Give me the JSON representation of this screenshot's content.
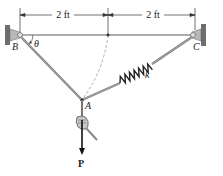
{
  "figure": {
    "dimensions": [
      {
        "id": "left",
        "label": "2 ft"
      },
      {
        "id": "right",
        "label": "2 ft"
      }
    ],
    "points": {
      "B": "B",
      "C": "C",
      "A": "A"
    },
    "angle_label": "θ",
    "spring_label": "k",
    "force_label": "P",
    "colors": {
      "cord": "#6b6b6b",
      "spring": "#2a2a2a",
      "wall": "#8a8a8a",
      "line": "#333333",
      "dashed_arc": "#9a9a9a"
    }
  }
}
